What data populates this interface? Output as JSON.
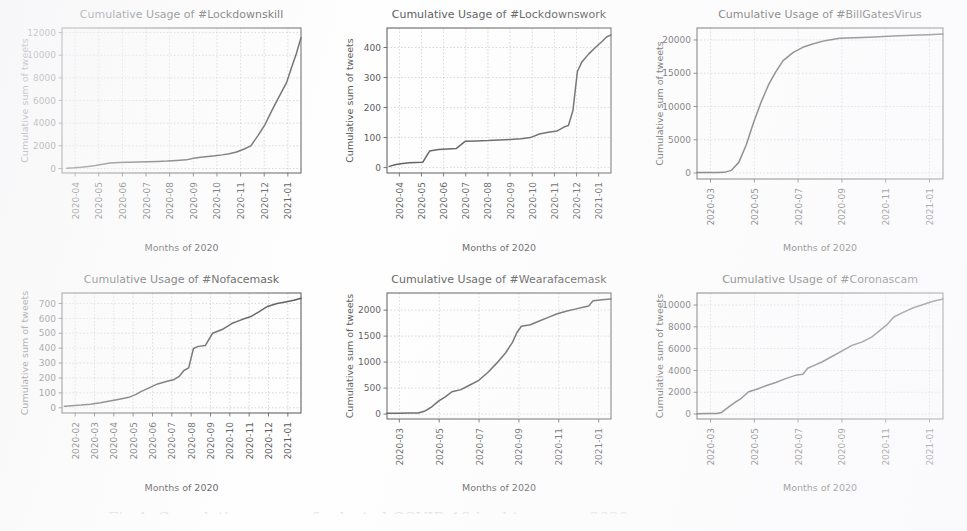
{
  "figure": {
    "caption": "Fig 1. Cumulative usage of selected COVID-19 hashtags over 2020",
    "axis_label_x": "Months of 2020",
    "axis_label_y": "Cumulative sum of tweets",
    "line_color": "#333333",
    "grid_color": "#8a8aa8",
    "background_color": "#fefefe"
  },
  "chart_data": [
    {
      "id": "lockdownskill",
      "type": "line",
      "title": "Cumulative Usage of #Lockdownskill",
      "xlabel": "Months of 2020",
      "ylabel": "Cumulative sum of tweets",
      "xticklabels": [
        "2020-04",
        "2020-05",
        "2020-06",
        "2020-07",
        "2020-08",
        "2020-09",
        "2020-10",
        "2020-11",
        "2020-12",
        "2021-01"
      ],
      "yticks": [
        0,
        2000,
        4000,
        6000,
        8000,
        10000,
        12000
      ],
      "ylim": [
        -400,
        12400
      ],
      "grid": true,
      "x": [
        0.02,
        0.05,
        0.08,
        0.11,
        0.14,
        0.17,
        0.2,
        0.24,
        0.28,
        0.32,
        0.36,
        0.4,
        0.44,
        0.48,
        0.52,
        0.55,
        0.58,
        0.61,
        0.64,
        0.67,
        0.7,
        0.73,
        0.76,
        0.79,
        0.82,
        0.85,
        0.88,
        0.91,
        0.94,
        0.96,
        0.98,
        1.0
      ],
      "values": [
        30,
        60,
        110,
        180,
        260,
        380,
        480,
        530,
        560,
        580,
        600,
        620,
        650,
        700,
        760,
        900,
        1000,
        1060,
        1120,
        1200,
        1300,
        1450,
        1700,
        2000,
        2900,
        3900,
        5200,
        6400,
        7600,
        8900,
        10100,
        11550
      ]
    },
    {
      "id": "lockdownswork",
      "type": "line",
      "title": "Cumulative Usage of #Lockdownswork",
      "xlabel": "Months of 2020",
      "ylabel": "Cumulative sum of tweets",
      "xticklabels": [
        "2020-04",
        "2020-05",
        "2020-06",
        "2020-07",
        "2020-08",
        "2020-09",
        "2020-10",
        "2020-11",
        "2020-12",
        "2021-01"
      ],
      "yticks": [
        0,
        100,
        200,
        300,
        400
      ],
      "ylim": [
        -18,
        465
      ],
      "grid": true,
      "x": [
        0.01,
        0.04,
        0.07,
        0.1,
        0.13,
        0.16,
        0.19,
        0.23,
        0.27,
        0.31,
        0.35,
        0.4,
        0.45,
        0.5,
        0.55,
        0.6,
        0.64,
        0.68,
        0.72,
        0.76,
        0.79,
        0.81,
        0.83,
        0.85,
        0.87,
        0.9,
        0.93,
        0.96,
        0.98,
        1.0
      ],
      "values": [
        4,
        10,
        14,
        16,
        17,
        18,
        55,
        60,
        62,
        64,
        88,
        89,
        90,
        92,
        94,
        96,
        100,
        112,
        118,
        122,
        135,
        140,
        190,
        320,
        352,
        378,
        400,
        420,
        435,
        442
      ]
    },
    {
      "id": "billgatesvirus",
      "type": "line",
      "title": "Cumulative Usage of #BillGatesVirus",
      "xlabel": "Months of 2020",
      "ylabel": "Cumulative sum of tweets",
      "xticklabels": [
        "2020-03",
        "2020-05",
        "2020-07",
        "2020-09",
        "2020-11",
        "2021-01"
      ],
      "yticks": [
        0,
        5000,
        10000,
        15000,
        20000
      ],
      "ylim": [
        -900,
        21800
      ],
      "grid": true,
      "x": [
        0.0,
        0.04,
        0.08,
        0.11,
        0.14,
        0.17,
        0.2,
        0.23,
        0.26,
        0.29,
        0.32,
        0.35,
        0.39,
        0.43,
        0.47,
        0.52,
        0.58,
        0.64,
        0.7,
        0.76,
        0.82,
        0.88,
        0.94,
        1.0
      ],
      "values": [
        60,
        70,
        80,
        100,
        400,
        1600,
        4200,
        7600,
        10600,
        13200,
        15200,
        16900,
        18100,
        18900,
        19400,
        19900,
        20250,
        20350,
        20420,
        20520,
        20620,
        20720,
        20800,
        20880
      ]
    },
    {
      "id": "nofacemask",
      "type": "line",
      "title": "Cumulative Usage of #Nofacemask",
      "xlabel": "Months of 2020",
      "ylabel": "Cumulative sum of tweets",
      "xticklabels": [
        "2020-02",
        "2020-03",
        "2020-04",
        "2020-05",
        "2020-06",
        "2020-07",
        "2020-08",
        "2020-09",
        "2020-10",
        "2020-11",
        "2020-12",
        "2021-01"
      ],
      "yticks": [
        0,
        100,
        200,
        300,
        400,
        500,
        600,
        700
      ],
      "ylim": [
        -35,
        770
      ],
      "grid": true,
      "x": [
        0.01,
        0.04,
        0.08,
        0.12,
        0.16,
        0.2,
        0.24,
        0.28,
        0.31,
        0.33,
        0.36,
        0.4,
        0.44,
        0.47,
        0.49,
        0.51,
        0.53,
        0.55,
        0.57,
        0.6,
        0.63,
        0.67,
        0.71,
        0.75,
        0.79,
        0.82,
        0.84,
        0.86,
        0.9,
        0.94,
        0.97,
        1.0
      ],
      "values": [
        10,
        14,
        18,
        24,
        34,
        46,
        58,
        70,
        90,
        108,
        130,
        160,
        178,
        190,
        210,
        250,
        268,
        398,
        412,
        418,
        500,
        525,
        565,
        590,
        612,
        640,
        660,
        680,
        700,
        712,
        722,
        735
      ]
    },
    {
      "id": "wearafacemask",
      "type": "line",
      "title": "Cumulative Usage of #Wearafacemask",
      "xlabel": "Months of 2020",
      "ylabel": "Cumulative sum of tweets",
      "xticklabels": [
        "2020-03",
        "2020-05",
        "2020-07",
        "2020-09",
        "2020-11",
        "2021-01"
      ],
      "yticks": [
        0,
        500,
        1000,
        1500,
        2000
      ],
      "ylim": [
        -95,
        2330
      ],
      "grid": true,
      "x": [
        0.0,
        0.05,
        0.1,
        0.14,
        0.17,
        0.2,
        0.23,
        0.26,
        0.29,
        0.33,
        0.37,
        0.41,
        0.45,
        0.49,
        0.53,
        0.56,
        0.58,
        0.6,
        0.64,
        0.68,
        0.72,
        0.76,
        0.8,
        0.84,
        0.88,
        0.9,
        0.92,
        0.96,
        1.0
      ],
      "values": [
        15,
        18,
        20,
        22,
        60,
        140,
        250,
        330,
        430,
        470,
        560,
        650,
        800,
        980,
        1180,
        1380,
        1570,
        1690,
        1720,
        1790,
        1860,
        1930,
        1980,
        2020,
        2060,
        2080,
        2180,
        2200,
        2215
      ]
    },
    {
      "id": "coronascam",
      "type": "line",
      "title": "Cumulative Usage of #Coronascam",
      "xlabel": "Months of 2020",
      "ylabel": "Cumulative sum of tweets",
      "xticklabels": [
        "2020-03",
        "2020-05",
        "2020-07",
        "2020-09",
        "2020-11",
        "2021-01"
      ],
      "yticks": [
        0,
        2000,
        4000,
        6000,
        8000,
        10000
      ],
      "ylim": [
        -450,
        11100
      ],
      "grid": true,
      "x": [
        0.0,
        0.04,
        0.08,
        0.1,
        0.12,
        0.15,
        0.18,
        0.21,
        0.24,
        0.28,
        0.32,
        0.36,
        0.4,
        0.43,
        0.45,
        0.47,
        0.51,
        0.55,
        0.59,
        0.63,
        0.67,
        0.71,
        0.74,
        0.77,
        0.8,
        0.84,
        0.88,
        0.92,
        0.96,
        1.0
      ],
      "values": [
        40,
        50,
        60,
        150,
        500,
        1000,
        1450,
        2050,
        2250,
        2600,
        2900,
        3250,
        3550,
        3650,
        4200,
        4400,
        4800,
        5300,
        5800,
        6300,
        6600,
        7050,
        7600,
        8150,
        8900,
        9350,
        9750,
        10050,
        10350,
        10550
      ]
    }
  ]
}
